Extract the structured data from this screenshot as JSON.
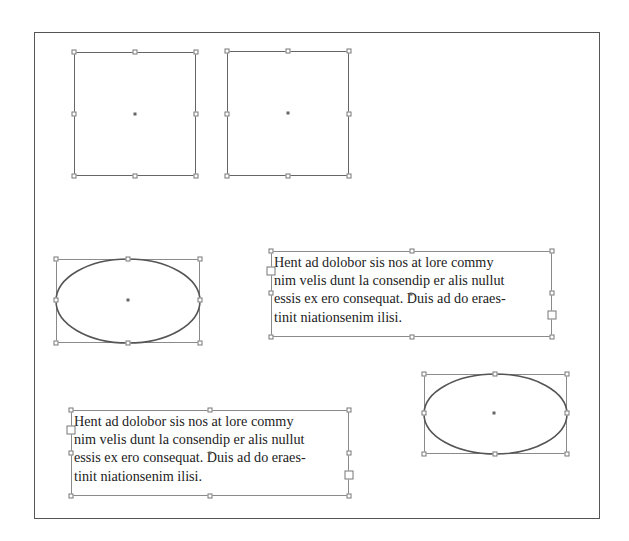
{
  "canvas": {
    "frame": {
      "x": 34,
      "y": 32,
      "w": 566,
      "h": 487
    }
  },
  "objects": [
    {
      "id": "square-1",
      "type": "rectangle",
      "x": 74,
      "y": 52,
      "w": 122,
      "h": 124,
      "selected": true
    },
    {
      "id": "square-2",
      "type": "rectangle",
      "x": 227,
      "y": 51,
      "w": 122,
      "h": 125,
      "selected": true
    },
    {
      "id": "ellipse-1",
      "type": "ellipse",
      "x": 56,
      "y": 259,
      "w": 144,
      "h": 84,
      "selected": true
    },
    {
      "id": "ellipse-2",
      "type": "ellipse",
      "x": 424,
      "y": 374,
      "w": 143,
      "h": 80,
      "selected": true
    }
  ],
  "text_frames": [
    {
      "id": "text-frame-1",
      "x": 271,
      "y": 251,
      "w": 281,
      "h": 86,
      "lines": [
        "Hent ad dolobor sis nos at lore commy",
        "nim velis dunt la consendip er alis nullut",
        "essis ex ero consequat. Duis ad do eraes-",
        "tinit niationsenim ilisi."
      ],
      "in_port_y": 271,
      "out_port_y": 316
    },
    {
      "id": "text-frame-2",
      "x": 71,
      "y": 410,
      "w": 278,
      "h": 86,
      "lines": [
        "Hent ad dolobor sis nos at lore commy",
        "nim velis dunt la consendip er alis nullut",
        "essis ex ero consequat. Duis ad do eraes-",
        "tinit niationsenim ilisi."
      ],
      "in_port_y": 430,
      "out_port_y": 475
    }
  ],
  "colors": {
    "stroke": "#666666",
    "handle": "#777777",
    "text": "#222222",
    "background": "#ffffff"
  }
}
